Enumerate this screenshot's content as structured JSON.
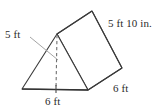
{
  "figure": {
    "name": "triangular-prism-diagram",
    "shape": "triangular prism",
    "background_color": "#ffffff",
    "stroke_color": "#3a3a3a",
    "dashed_stroke_color": "#6b6b6b",
    "leader_color": "#8a8a8a",
    "labels": {
      "height": "5 ft",
      "slant": "5 ft 10 in.",
      "base": "6 ft",
      "depth": "6 ft"
    },
    "annotations": {
      "height_line_style": "dashed",
      "height_leader": true,
      "base_tick": true
    },
    "measurements": [
      {
        "name": "triangle-height",
        "value": "5 ft",
        "edge": "altitude-of-triangular-face"
      },
      {
        "name": "triangle-base",
        "value": "6 ft",
        "edge": "base-of-triangular-face"
      },
      {
        "name": "prism-length",
        "value": "5 ft 10 in.",
        "edge": "lateral-edge-rectangular-face"
      },
      {
        "name": "triangle-side",
        "value": "6 ft",
        "edge": "slanted-base-edge"
      }
    ],
    "geometry": {
      "front_triangle": [
        [
          22,
          89
        ],
        [
          88,
          90
        ],
        [
          57,
          34
        ]
      ],
      "back_triangle": [
        [
          57,
          34
        ],
        [
          92,
          11
        ],
        [
          122,
          68
        ]
      ],
      "rect_face": [
        [
          57,
          34
        ],
        [
          92,
          11
        ],
        [
          122,
          68
        ],
        [
          88,
          90
        ]
      ],
      "altitude": [
        [
          57,
          35
        ],
        [
          56,
          89
        ]
      ],
      "leader": [
        [
          30,
          37
        ],
        [
          58,
          60
        ]
      ]
    }
  }
}
